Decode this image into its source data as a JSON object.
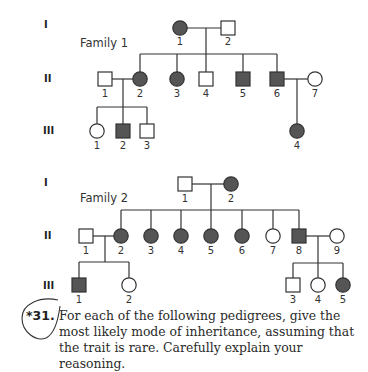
{
  "colors": {
    "affected": "#555555",
    "unaffected": "#ffffff",
    "stroke": "#333333"
  },
  "generation_labels": [
    "I",
    "II",
    "III"
  ],
  "family1": {
    "label": "Family 1",
    "gen1": [
      {
        "id": "1",
        "sex": "female",
        "affected": true
      },
      {
        "id": "2",
        "sex": "male",
        "affected": false
      }
    ],
    "gen2": [
      {
        "id": "1",
        "sex": "male",
        "affected": false,
        "note": "married-in"
      },
      {
        "id": "2",
        "sex": "female",
        "affected": true
      },
      {
        "id": "3",
        "sex": "female",
        "affected": true
      },
      {
        "id": "4",
        "sex": "male",
        "affected": false
      },
      {
        "id": "5",
        "sex": "male",
        "affected": true
      },
      {
        "id": "6",
        "sex": "male",
        "affected": true
      },
      {
        "id": "7",
        "sex": "female",
        "affected": false,
        "note": "married-in"
      }
    ],
    "gen3": [
      {
        "id": "1",
        "sex": "female",
        "affected": false,
        "parents": "II-1 x II-2"
      },
      {
        "id": "2",
        "sex": "male",
        "affected": true,
        "parents": "II-1 x II-2"
      },
      {
        "id": "3",
        "sex": "male",
        "affected": false,
        "parents": "II-1 x II-2"
      },
      {
        "id": "4",
        "sex": "female",
        "affected": true,
        "parents": "II-6 x II-7"
      }
    ]
  },
  "family2": {
    "label": "Family 2",
    "gen1": [
      {
        "id": "1",
        "sex": "male",
        "affected": false
      },
      {
        "id": "2",
        "sex": "female",
        "affected": true
      }
    ],
    "gen2": [
      {
        "id": "1",
        "sex": "male",
        "affected": false,
        "note": "married-in"
      },
      {
        "id": "2",
        "sex": "female",
        "affected": true
      },
      {
        "id": "3",
        "sex": "female",
        "affected": true
      },
      {
        "id": "4",
        "sex": "female",
        "affected": true
      },
      {
        "id": "5",
        "sex": "female",
        "affected": true
      },
      {
        "id": "6",
        "sex": "female",
        "affected": true
      },
      {
        "id": "7",
        "sex": "female",
        "affected": false
      },
      {
        "id": "8",
        "sex": "male",
        "affected": true
      },
      {
        "id": "9",
        "sex": "female",
        "affected": false,
        "note": "married-in"
      }
    ],
    "gen3": [
      {
        "id": "1",
        "sex": "male",
        "affected": true,
        "parents": "II-1 x II-2"
      },
      {
        "id": "2",
        "sex": "female",
        "affected": false,
        "parents": "II-1 x II-2"
      },
      {
        "id": "3",
        "sex": "male",
        "affected": false,
        "parents": "II-8 x II-9"
      },
      {
        "id": "4",
        "sex": "female",
        "affected": false,
        "parents": "II-8 x II-9"
      },
      {
        "id": "5",
        "sex": "female",
        "affected": true,
        "parents": "II-8 x II-9"
      }
    ]
  },
  "question": {
    "number": "*31.",
    "text": "For each of the following pedigrees, give the most likely mode of inheritance, assuming that the trait is rare. Carefully explain your reasoning."
  }
}
